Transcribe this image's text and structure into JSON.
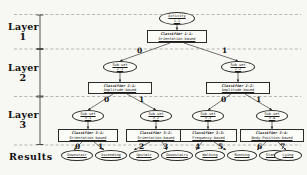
{
  "diagram": {
    "layer_labels": [
      {
        "word": "Layer",
        "num": "1"
      },
      {
        "word": "Layer",
        "num": "2"
      },
      {
        "word": "Layer",
        "num": "3"
      }
    ],
    "results_label": "Results",
    "root": {
      "line1": "Activity",
      "line2": "1-1"
    },
    "classifier_l1": {
      "line1": "Classifier 1-1:",
      "line2": "Orientation-based"
    },
    "branch_labels_l1": [
      "0",
      "1"
    ],
    "subsets_l2": [
      {
        "line1": "Sub-set",
        "line2": "2-1"
      },
      {
        "line1": "Sub-set",
        "line2": "2-2"
      }
    ],
    "classifiers_l2": [
      {
        "line1": "Classifier 2-1:",
        "line2": "Amplitude-based"
      },
      {
        "line1": "Classifier 2-2:",
        "line2": "Amplitude-based"
      }
    ],
    "branch_labels_l2": [
      "0",
      "1",
      "0",
      "1"
    ],
    "subsets_l3": [
      {
        "line1": "Sub-set",
        "line2": "3-1"
      },
      {
        "line1": "Sub-set",
        "line2": "3-2"
      },
      {
        "line1": "Sub-set",
        "line2": "3-3"
      },
      {
        "line1": "Sub-set",
        "line2": "3-4"
      }
    ],
    "classifiers_l3": [
      {
        "line1": "Classifier 3-1:",
        "line2": "Orientation-based"
      },
      {
        "line1": "Classifier 3-2:",
        "line2": "Orientation-based"
      },
      {
        "line1": "Classifier 3-3:",
        "line2": "Frequency-based"
      },
      {
        "line1": "Classifier 3-4:",
        "line2": "Body-Position-based"
      }
    ],
    "result_edge_labels": [
      "0",
      "1",
      "2",
      "3",
      "4",
      "5",
      "6",
      "7"
    ],
    "results": [
      {
        "label": "Downstair"
      },
      {
        "label": "Ascending"
      },
      {
        "label": "Upstair"
      },
      {
        "label": "Downstairs"
      },
      {
        "label": "Walking"
      },
      {
        "label": "Running"
      },
      {
        "label": "Standing"
      },
      {
        "label": "Lying"
      }
    ],
    "colors": {
      "background": "#f7f7f3",
      "node_fill": "#fbfbf8",
      "stroke": "#2a2a2a",
      "text": "#1a1a1a",
      "divider": "#9a9a9a"
    }
  }
}
